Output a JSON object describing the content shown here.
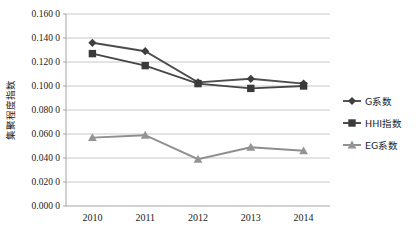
{
  "chart_data": {
    "type": "line",
    "title": "",
    "xlabel": "",
    "ylabel": "集聚程度指数",
    "categories": [
      "2010",
      "2011",
      "2012",
      "2013",
      "2014"
    ],
    "ylim": [
      0.0,
      0.16
    ],
    "ytick_step": 0.02,
    "ytick_labels": [
      "0.000 0",
      "0.020 0",
      "0.040 0",
      "0.060 0",
      "0.080 0",
      "0.100 0",
      "0.120 0",
      "0.140 0",
      "0.160 0"
    ],
    "ytick_values": [
      0.0,
      0.02,
      0.04,
      0.06,
      0.08,
      0.1,
      0.12,
      0.14,
      0.16
    ],
    "grid": true,
    "legend_position": "right",
    "series": [
      {
        "name": "G系数",
        "marker": "diamond",
        "color": "#3f3f3f",
        "values": [
          0.136,
          0.129,
          0.103,
          0.106,
          0.102
        ]
      },
      {
        "name": "HHI指数",
        "marker": "square",
        "color": "#3a3a3a",
        "values": [
          0.127,
          0.117,
          0.102,
          0.098,
          0.1
        ]
      },
      {
        "name": "EG系数",
        "marker": "triangle",
        "color": "#949494",
        "values": [
          0.057,
          0.059,
          0.039,
          0.049,
          0.046
        ]
      }
    ]
  }
}
